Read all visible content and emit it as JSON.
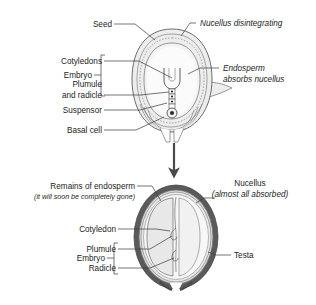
{
  "figure": {
    "background_color": "#ffffff"
  },
  "colors": {
    "outline": "#5c5c5c",
    "leader": "#3a3a3a",
    "text": "#1d1d1d",
    "seed_coat_fill": "#ededed",
    "endosperm_fill": "#f4f4f4",
    "nucellus_fill": "#e4e4e4",
    "embryo_fill": "#fbfbfb",
    "testa_dark": "#5a5a5a",
    "cotyledon_fill": "#e8e8e8",
    "inner_light": "#f7f7f7",
    "arrow": "#4a4a4a"
  },
  "top_diagram": {
    "name": "developing-seed",
    "labels_left": [
      {
        "id": "seed",
        "text": "Seed",
        "italic": false
      },
      {
        "id": "cotyledons",
        "text": "Cotyledons",
        "italic": false
      },
      {
        "id": "plumule-line1",
        "text": "Plumule",
        "italic": false
      },
      {
        "id": "plumule-line2",
        "text": "and radicle",
        "italic": false
      },
      {
        "id": "suspensor",
        "text": "Suspensor",
        "italic": false
      },
      {
        "id": "basal-cell",
        "text": "Basal cell",
        "italic": false
      }
    ],
    "bracket_label": {
      "id": "embryo",
      "text": "Embryo"
    },
    "labels_right": [
      {
        "id": "nucellus-disintegrating",
        "text": "Nucellus disintegrating",
        "italic": true
      },
      {
        "id": "endosperm-line1",
        "text": "Endosperm",
        "italic": true
      },
      {
        "id": "endosperm-line2",
        "text": "absorbs nucellus",
        "italic": true
      }
    ]
  },
  "arrow": {
    "name": "progression-arrow",
    "direction": "down"
  },
  "bottom_diagram": {
    "name": "mature-seed",
    "labels_left": [
      {
        "id": "remains-of-endosperm",
        "text": "Remains of endosperm",
        "italic": false
      },
      {
        "id": "remains-note",
        "text": "(it will soon be completely gone)",
        "italic": true
      },
      {
        "id": "cotyledon",
        "text": "Cotyledon",
        "italic": false
      },
      {
        "id": "plumule",
        "text": "Plumule",
        "italic": false
      },
      {
        "id": "radicle",
        "text": "Radicle",
        "italic": false
      }
    ],
    "bracket_label": {
      "id": "embryo",
      "text": "Embryo"
    },
    "labels_right": [
      {
        "id": "nucellus",
        "text": "Nucellus",
        "italic": false
      },
      {
        "id": "nucellus-note",
        "text": "(almost all absorbed)",
        "italic": true
      },
      {
        "id": "testa",
        "text": "Testa",
        "italic": false
      }
    ]
  }
}
